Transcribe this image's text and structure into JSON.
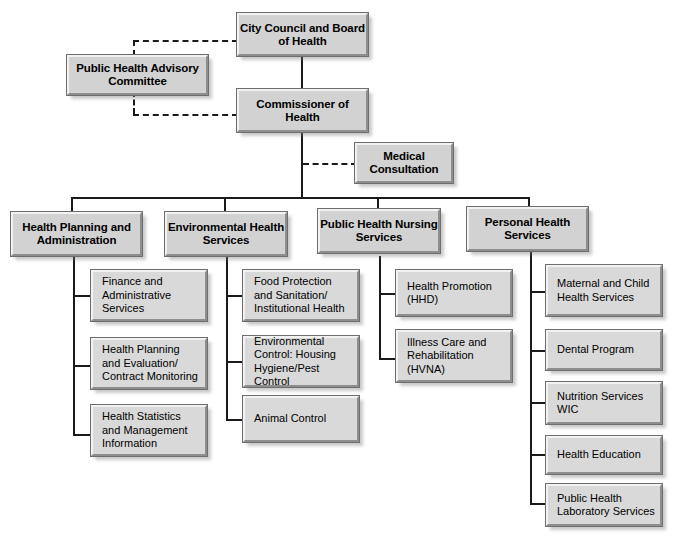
{
  "chart": {
    "type": "org-chart",
    "nodes": {
      "city_council": "City Council and Board of Health",
      "advisory": "Public Health Advisory Committee",
      "commissioner": "Commissioner of Health",
      "medical": "Medical Consultation"
    },
    "divisions": [
      {
        "label": "Health Planning and Administration",
        "children": [
          "Finance and Administrative Services",
          "Health Planning and Evaluation/ Contract Monitoring",
          "Health Statistics and Management Information"
        ]
      },
      {
        "label": "Environmental Health Services",
        "children": [
          "Food Protection and Sanitation/ Institutional Health",
          "Environmental Control: Housing Hygiene/Pest Control",
          "Animal Control"
        ]
      },
      {
        "label": "Public Health Nursing Services",
        "children": [
          "Health Promotion (HHD)",
          "Illness Care and Rehabilitation (HVNA)"
        ]
      },
      {
        "label": "Personal Health Services",
        "children": [
          "Maternal and Child Health Services",
          "Dental Program",
          "Nutrition Services WIC",
          "Health Education",
          "Public Health Laboratory Services"
        ]
      }
    ],
    "colors": {
      "box_fill": "#d2d2d2",
      "sub_box_fill": "#d9d9d9",
      "line": "#1a1a1a",
      "text": "#000000",
      "background": "#ffffff"
    }
  }
}
